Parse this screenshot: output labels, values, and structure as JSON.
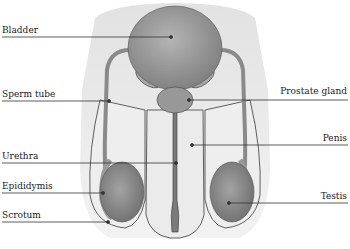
{
  "diagram": {
    "labels": {
      "bladder": "Bladder",
      "sperm_tube": "Sperm tube",
      "urethra": "Urethra",
      "epididymis": "Epididymis",
      "scrotum": "Scrotum",
      "prostate_gland": "Prostate gland",
      "penis": "Penis",
      "testis": "Testis"
    },
    "colors": {
      "background": "#ffffff",
      "body_shadow": "#e8e8e8",
      "skin": "#ececec",
      "bladder": "#9a9a9a",
      "testis": "#8c8c8c",
      "outline": "#3a3a3a",
      "leader_line": "#333333"
    }
  }
}
